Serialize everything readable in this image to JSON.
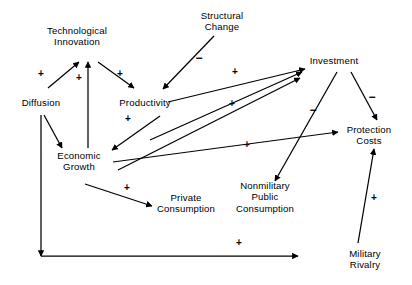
{
  "diagram": {
    "background_color": "#ffffff",
    "line_color": "#000000",
    "text_color": "#000000",
    "width": 412,
    "height": 285,
    "nodes": [
      {
        "id": "technological_innovation",
        "label": "Technological\nInnovation",
        "x": 77,
        "y": 36
      },
      {
        "id": "structural_change",
        "label": "Structural\nChange",
        "x": 222,
        "y": 21
      },
      {
        "id": "investment",
        "label": "Investment",
        "x": 334,
        "y": 61
      },
      {
        "id": "diffusion",
        "label": "Diffusion",
        "x": 41,
        "y": 103
      },
      {
        "id": "productivity",
        "label": "Productivity",
        "x": 145,
        "y": 103
      },
      {
        "id": "protection_costs",
        "label": "Protection\nCosts",
        "x": 369,
        "y": 135
      },
      {
        "id": "economic_growth",
        "label": "Economic\nGrowth",
        "x": 79,
        "y": 161
      },
      {
        "id": "private_consumption",
        "label": "Private\nConsumption",
        "x": 186,
        "y": 203
      },
      {
        "id": "nonmilitary_public_consumption",
        "label": "Nonmilitary\nPublic\nConsumption",
        "x": 265,
        "y": 197
      },
      {
        "id": "military_rivalry",
        "label": "Military\nRivalry",
        "x": 365,
        "y": 259
      }
    ],
    "edges": [
      {
        "id": "e1",
        "from": "diffusion",
        "to": "technological_innovation",
        "sign": "+",
        "x1": 48,
        "y1": 88,
        "x2": 79,
        "y2": 62,
        "sign_x": 41,
        "sign_y": 74
      },
      {
        "id": "e2",
        "from": "technological_innovation",
        "to": "productivity",
        "sign": "+",
        "x1": 98,
        "y1": 62,
        "x2": 134,
        "y2": 88,
        "sign_x": 120,
        "sign_y": 74
      },
      {
        "id": "e3",
        "from": "economic_growth",
        "to": "technological_innovation",
        "sign": "+",
        "x1": 88,
        "y1": 148,
        "x2": 88,
        "y2": 62,
        "sign_x": 79,
        "sign_y": 78
      },
      {
        "id": "e4",
        "from": "diffusion",
        "to": "economic_growth",
        "sign": "",
        "x1": 44,
        "y1": 115,
        "x2": 62,
        "y2": 148,
        "sign_x": 0,
        "sign_y": 0
      },
      {
        "id": "e5",
        "from": "structural_change",
        "to": "productivity",
        "sign": "−",
        "x1": 214,
        "y1": 36,
        "x2": 163,
        "y2": 89,
        "sign_x": 199,
        "sign_y": 58
      },
      {
        "id": "e6",
        "from": "productivity",
        "to": "economic_growth",
        "sign": "+",
        "x1": 160,
        "y1": 116,
        "x2": 112,
        "y2": 150,
        "sign_x": 128,
        "sign_y": 119
      },
      {
        "id": "e7",
        "from": "productivity",
        "to": "investment",
        "sign": "+",
        "x1": 168,
        "y1": 102,
        "x2": 305,
        "y2": 69,
        "sign_x": 235,
        "sign_y": 72
      },
      {
        "id": "e8",
        "from": "economic_growth",
        "to": "investment",
        "sign": "+",
        "x1": 150,
        "y1": 140,
        "x2": 302,
        "y2": 72,
        "sign_x": 232,
        "sign_y": 104
      },
      {
        "id": "e9",
        "from": "economic_growth",
        "to": "protection_costs",
        "sign": "+",
        "x1": 113,
        "y1": 162,
        "x2": 338,
        "y2": 132,
        "sign_x": 247,
        "sign_y": 145
      },
      {
        "id": "e10",
        "from": "economic_growth",
        "to": "private_consumption",
        "sign": "+",
        "x1": 85,
        "y1": 184,
        "x2": 152,
        "y2": 206,
        "sign_x": 127,
        "sign_y": 188
      },
      {
        "id": "e11",
        "from": "investment",
        "to": "nonmilitary_public_consumption",
        "sign": "−",
        "x1": 337,
        "y1": 72,
        "x2": 275,
        "y2": 181,
        "sign_x": 313,
        "sign_y": 110
      },
      {
        "id": "e12",
        "from": "investment",
        "to": "protection_costs",
        "sign": "−",
        "x1": 351,
        "y1": 72,
        "x2": 377,
        "y2": 120,
        "sign_x": 372,
        "sign_y": 97
      },
      {
        "id": "e13",
        "from": "economic_growth",
        "to": "investment",
        "sign": "",
        "x1": 118,
        "y1": 170,
        "x2": 300,
        "y2": 78,
        "sign_x": 0,
        "sign_y": 0
      },
      {
        "id": "e14",
        "from": "military_rivalry",
        "to": "protection_costs",
        "sign": "+",
        "x1": 358,
        "y1": 243,
        "x2": 374,
        "y2": 149,
        "sign_x": 374,
        "sign_y": 198
      },
      {
        "id": "e15",
        "from": "diffusion",
        "to": "military_rivalry",
        "sign": "+",
        "x1": 41,
        "y1": 115,
        "x2": 41,
        "y2": 256,
        "sign_x": 239,
        "sign_y": 243
      },
      {
        "id": "e16",
        "from": "diffusion_axis",
        "to": "military_rivalry",
        "sign": "",
        "x1": 41,
        "y1": 256,
        "x2": 298,
        "y2": 256,
        "sign_x": 0,
        "sign_y": 0
      }
    ],
    "signs": [
      {
        "id": "s1",
        "text": "+",
        "x": 41,
        "y": 74
      },
      {
        "id": "s2",
        "text": "+",
        "x": 79,
        "y": 78
      },
      {
        "id": "s3",
        "text": "+",
        "x": 120,
        "y": 74
      },
      {
        "id": "s4",
        "text": "−",
        "x": 199,
        "y": 58
      },
      {
        "id": "s5",
        "text": "+",
        "x": 235,
        "y": 72
      },
      {
        "id": "s6",
        "text": "+",
        "x": 128,
        "y": 119
      },
      {
        "id": "s7",
        "text": "+",
        "x": 232,
        "y": 104
      },
      {
        "id": "s8",
        "text": "−",
        "x": 313,
        "y": 110
      },
      {
        "id": "s9",
        "text": "−",
        "x": 372,
        "y": 97
      },
      {
        "id": "s10",
        "text": "+",
        "x": 247,
        "y": 145
      },
      {
        "id": "s11",
        "text": "+",
        "x": 127,
        "y": 188
      },
      {
        "id": "s12",
        "text": "+",
        "x": 374,
        "y": 198
      },
      {
        "id": "s13",
        "text": "+",
        "x": 239,
        "y": 243
      }
    ]
  }
}
